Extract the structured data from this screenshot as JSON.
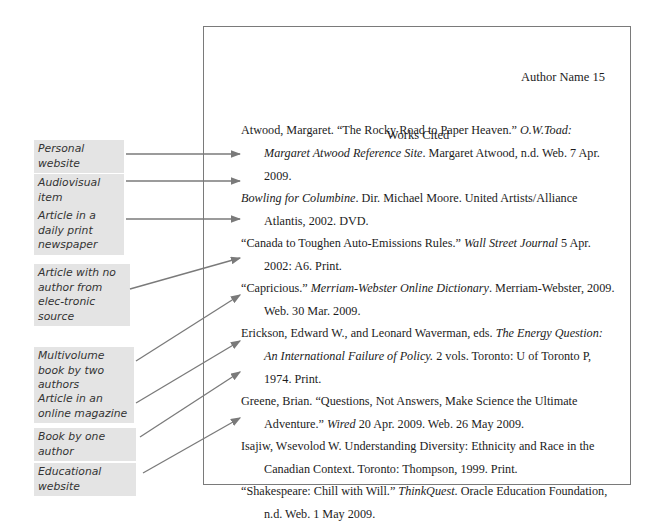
{
  "page": {
    "header": "Author Name 15",
    "title": "Works Cited"
  },
  "citations": [
    {
      "parts": [
        {
          "t": "Atwood, Margaret. “The Rocky Road to Paper Heaven.” "
        },
        {
          "t": "O.W.Toad: Margaret Atwood Reference Site",
          "i": true
        },
        {
          "t": ". Margaret Atwood, n.d. Web. 7 Apr. 2009."
        }
      ]
    },
    {
      "parts": [
        {
          "t": "Bowling for Columbine",
          "i": true
        },
        {
          "t": ". Dir. Michael Moore. United Artists/Alliance Atlantis, 2002. DVD."
        }
      ]
    },
    {
      "parts": [
        {
          "t": "“Canada to Toughen Auto-Emissions Rules.” "
        },
        {
          "t": "Wall Street Journal",
          "i": true
        },
        {
          "t": " 5 Apr. 2002: A6. Print."
        }
      ]
    },
    {
      "parts": [
        {
          "t": "“Capricious.” "
        },
        {
          "t": "Merriam-Webster Online Dictionary",
          "i": true
        },
        {
          "t": ". Merriam-Webster, 2009. Web. 30 Mar. 2009."
        }
      ]
    },
    {
      "parts": [
        {
          "t": "Erickson, Edward W., and Leonard Waverman, eds. "
        },
        {
          "t": "The Energy Question: An International Failure of Policy.",
          "i": true
        },
        {
          "t": " 2 vols. Toronto: U of Toronto P, 1974. Print."
        }
      ]
    },
    {
      "parts": [
        {
          "t": "Greene, Brian. “Questions, Not Answers, Make Science the Ultimate Adventure.” "
        },
        {
          "t": "Wired",
          "i": true
        },
        {
          "t": " 20 Apr. 2009. Web. 26 May 2009."
        }
      ]
    },
    {
      "parts": [
        {
          "t": "Isajiw, Wsevolod W. Understanding Diversity: Ethnicity and Race in the Canadian Context. Toronto: Thompson, 1999. Print."
        }
      ]
    },
    {
      "parts": [
        {
          "t": "“Shakespeare: Chill with Will.” "
        },
        {
          "t": "ThinkQuest",
          "i": true
        },
        {
          "t": ". Oracle Education Foundation, n.d. Web. 1 May 2009."
        }
      ]
    }
  ],
  "labels": [
    "Personal website",
    "Audiovisual item",
    "Article in a daily print newspaper",
    "Article with no author from elec-tronic source",
    "Multivolume book by two authors",
    "Article in an online magazine",
    "Book by one author",
    "Educational website"
  ],
  "colors": {
    "label_bg": "#e4e4e4",
    "arrow": "#7a7a7a",
    "border": "#7a7a7a"
  }
}
